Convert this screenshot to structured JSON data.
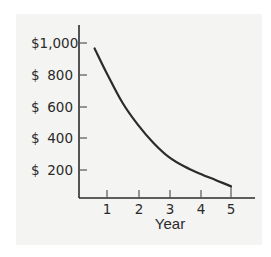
{
  "chart_data": {
    "type": "line",
    "title": "",
    "xlabel": "Year",
    "ylabel": "",
    "x_ticks": [
      "1",
      "2",
      "3",
      "4",
      "5"
    ],
    "y_ticks": [
      {
        "dollar": "$",
        "amount": "1,000",
        "value": 1000,
        "label": "$1,000"
      },
      {
        "dollar": "$",
        "amount": "800",
        "value": 800,
        "label": "$ 800"
      },
      {
        "dollar": "$",
        "amount": "600",
        "value": 600,
        "label": "$ 600"
      },
      {
        "dollar": "$",
        "amount": "400",
        "value": 400,
        "label": "$ 400"
      },
      {
        "dollar": "$",
        "amount": "200",
        "value": 200,
        "label": "$ 200"
      }
    ],
    "series": [
      {
        "name": "value",
        "x": [
          0.6,
          1,
          1.5,
          2,
          2.5,
          3,
          3.5,
          4,
          4.5,
          5
        ],
        "values": [
          965,
          805,
          620,
          480,
          365,
          275,
          215,
          170,
          130,
          90
        ]
      }
    ],
    "xlim": [
      0,
      5.8
    ],
    "ylim": [
      0,
      1100
    ],
    "grid": false,
    "legend": null,
    "colors": {
      "line": "#2b2b2b",
      "axis": "#2b2b2b",
      "panel": "#f4f4f3"
    }
  }
}
